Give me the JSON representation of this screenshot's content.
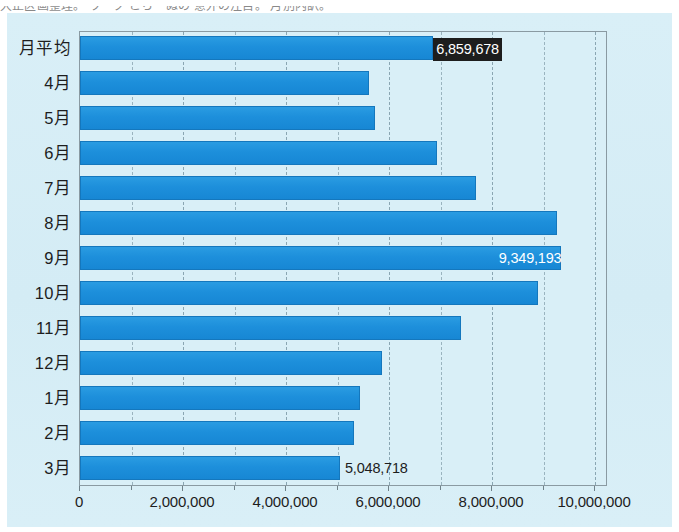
{
  "page": {
    "fragment_text": "大正区画整理。 ワーク  こち・ぬの 意外の注目。 月別内訳。"
  },
  "chart_data": {
    "type": "bar",
    "orientation": "horizontal",
    "title": "",
    "subtitle": "",
    "xlabel": "",
    "ylabel": "",
    "grid": true,
    "legend": "none",
    "xlim": [
      0,
      10000000
    ],
    "xticks": [
      0,
      2000000,
      4000000,
      6000000,
      8000000,
      10000000
    ],
    "xtick_labels": [
      "0",
      "2,000,000",
      "4,000,000",
      "6,000,000",
      "8,000,000",
      "10,000,000"
    ],
    "minor_gridline_step": 1000000,
    "bar_color": "#1f93dd",
    "panel_color": "#d7eef6",
    "categories": [
      "月平均",
      "4月",
      "5月",
      "6月",
      "7月",
      "8月",
      "9月",
      "10月",
      "11月",
      "12月",
      "1月",
      "2月",
      "3月"
    ],
    "values": [
      6859678,
      5610000,
      5720000,
      6930000,
      7680000,
      9270000,
      9349193,
      8890000,
      7400000,
      5860000,
      5440000,
      5330000,
      5048718
    ],
    "annotations": [
      {
        "category": "月平均",
        "text": "6,859,678",
        "style": "inverse-outside"
      },
      {
        "category": "9月",
        "text": "9,349,193",
        "style": "white-inside"
      },
      {
        "category": "3月",
        "text": "5,048,718",
        "style": "dark-outside"
      }
    ],
    "bars": [
      {
        "label": "月平均",
        "value": 6859678,
        "data_label": "6,859,678",
        "label_style": "inverse"
      },
      {
        "label": "4月",
        "value": 5610000,
        "data_label": "",
        "label_style": "none"
      },
      {
        "label": "5月",
        "value": 5720000,
        "data_label": "",
        "label_style": "none"
      },
      {
        "label": "6月",
        "value": 6930000,
        "data_label": "",
        "label_style": "none"
      },
      {
        "label": "7月",
        "value": 7680000,
        "data_label": "",
        "label_style": "none"
      },
      {
        "label": "8月",
        "value": 9270000,
        "data_label": "",
        "label_style": "none"
      },
      {
        "label": "9月",
        "value": 9349193,
        "data_label": "9,349,193",
        "label_style": "onbar"
      },
      {
        "label": "10月",
        "value": 8890000,
        "data_label": "",
        "label_style": "none"
      },
      {
        "label": "11月",
        "value": 7400000,
        "data_label": "",
        "label_style": "none"
      },
      {
        "label": "12月",
        "value": 5860000,
        "data_label": "",
        "label_style": "none"
      },
      {
        "label": "1月",
        "value": 5440000,
        "data_label": "",
        "label_style": "none"
      },
      {
        "label": "2月",
        "value": 5330000,
        "data_label": "",
        "label_style": "none"
      },
      {
        "label": "3月",
        "value": 5048718,
        "data_label": "5,048,718",
        "label_style": "outside"
      }
    ]
  }
}
